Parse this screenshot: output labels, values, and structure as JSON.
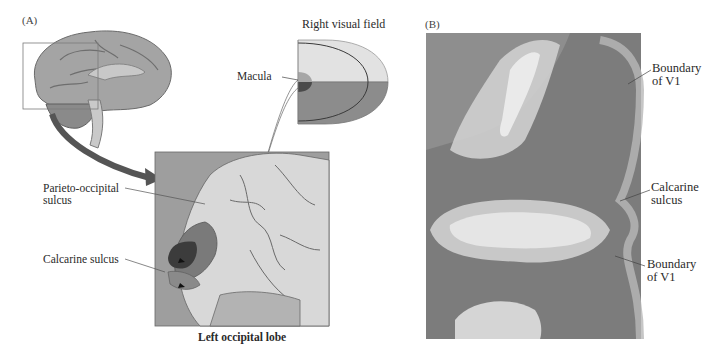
{
  "figure": {
    "panels": [
      {
        "id": "A",
        "letter": "(A)",
        "visual_field": {
          "title": "Right visual field",
          "macula_label": "Macula"
        },
        "inset": {
          "caption": "Left occipital lobe",
          "labels": {
            "parieto_occipital": [
              "Parieto-occipital",
              "sulcus"
            ],
            "calcarine": "Calcarine sulcus"
          }
        }
      },
      {
        "id": "B",
        "letter": "(B)",
        "labels": {
          "boundary_upper": [
            "Boundary",
            "of V1"
          ],
          "calcarine": [
            "Calcarine",
            "sulcus"
          ],
          "boundary_lower": [
            "Boundary",
            "of V1"
          ]
        }
      }
    ],
    "colors": {
      "upper_field_outer": "#e2e2e2",
      "upper_field_inner": "#cfcfcf",
      "lower_field_outer": "#8c8c8c",
      "lower_field_inner": "#7a7a7a",
      "macula_upper": "#a6a6a6",
      "macula_lower": "#4a4a4a",
      "arrow": "#555555",
      "brain": "#a9a9a9",
      "inset_bg": "#9e9e9e",
      "histology_dark": "#7c7c7c",
      "histology_light": "#d2d2d2"
    }
  }
}
